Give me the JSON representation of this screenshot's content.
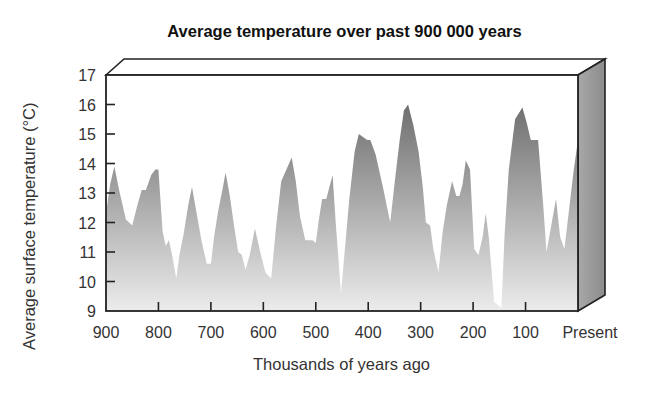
{
  "chart_data": {
    "type": "area",
    "title": "Average temperature over past 900 000 years",
    "xlabel": "Thousands of years ago",
    "ylabel": "Average surface temperature (°C)",
    "x_ticks": [
      "900",
      "800",
      "700",
      "600",
      "500",
      "400",
      "300",
      "200",
      "100",
      "Present"
    ],
    "x_tick_values": [
      900,
      800,
      700,
      600,
      500,
      400,
      300,
      200,
      100,
      0
    ],
    "y_ticks": [
      9,
      10,
      11,
      12,
      13,
      14,
      15,
      16,
      17
    ],
    "xlim": [
      900,
      0
    ],
    "ylim": [
      9,
      17
    ],
    "grid": false,
    "legend": null,
    "series": [
      {
        "name": "Average surface temperature",
        "x": [
          900,
          892,
          884,
          875,
          862,
          850,
          840,
          832,
          824,
          814,
          806,
          800,
          792,
          786,
          780,
          774,
          766,
          760,
          752,
          743,
          736,
          728,
          718,
          708,
          700,
          694,
          686,
          678,
          672,
          664,
          656,
          648,
          641,
          634,
          626,
          616,
          606,
          596,
          585,
          576,
          566,
          556,
          546,
          538,
          530,
          520,
          512,
          506,
          500,
          494,
          488,
          480,
          474,
          468,
          462,
          452,
          446,
          436,
          426,
          418,
          410,
          402,
          396,
          386,
          372,
          358,
          348,
          340,
          332,
          324,
          314,
          304,
          296,
          290,
          282,
          276,
          266,
          258,
          250,
          240,
          232,
          226,
          220,
          214,
          206,
          198,
          190,
          182,
          176,
          170,
          160,
          152,
          146,
          140,
          132,
          120,
          106,
          98,
          90,
          84,
          76,
          66,
          60,
          50,
          42,
          34,
          26,
          18,
          8,
          0
        ],
        "values": [
          12.3,
          13.3,
          13.9,
          13.1,
          12.1,
          11.9,
          12.6,
          13.1,
          13.1,
          13.6,
          13.8,
          13.8,
          11.7,
          11.2,
          11.4,
          10.9,
          10.1,
          10.9,
          11.6,
          12.6,
          13.2,
          12.4,
          11.4,
          10.6,
          10.6,
          11.5,
          12.4,
          13.1,
          13.7,
          12.9,
          11.9,
          11.0,
          10.9,
          10.4,
          10.9,
          11.8,
          11.0,
          10.3,
          10.1,
          11.8,
          13.4,
          13.8,
          14.2,
          13.4,
          12.2,
          11.4,
          11.4,
          11.4,
          11.3,
          12.1,
          12.8,
          12.8,
          13.2,
          13.6,
          12.0,
          9.6,
          10.8,
          12.8,
          14.4,
          15.0,
          14.9,
          14.8,
          14.8,
          14.3,
          13.2,
          12.0,
          13.6,
          14.8,
          15.8,
          16.0,
          15.3,
          14.4,
          13.2,
          12.0,
          11.9,
          11.1,
          10.3,
          11.7,
          12.6,
          13.4,
          12.9,
          12.9,
          13.3,
          14.1,
          13.8,
          11.1,
          10.9,
          11.5,
          12.3,
          11.5,
          9.3,
          9.2,
          9.1,
          11.6,
          13.8,
          15.5,
          15.9,
          15.4,
          14.8,
          14.8,
          14.8,
          12.5,
          11.0,
          12.0,
          12.8,
          11.5,
          11.1,
          12.3,
          13.8,
          14.8
        ]
      }
    ]
  },
  "labels": {
    "title": "Average temperature over past 900 000 years",
    "xlabel": "Thousands of years ago",
    "ylabel": "Average surface temperature (°C)"
  },
  "colors": {
    "area_top": "#6f6f6f",
    "area_bottom": "#ececec",
    "frame": "#222222",
    "side_panel": "#9a9a9a",
    "top_panel": "#ffffff"
  }
}
